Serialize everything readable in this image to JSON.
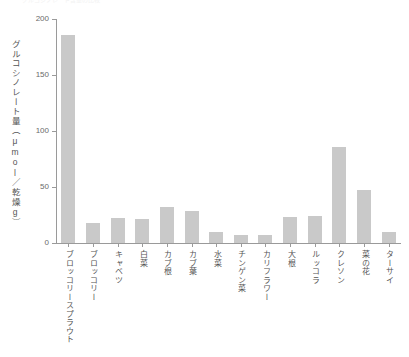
{
  "figure": {
    "top_clipped_text": "グルコシノレート含量の比較",
    "background_color": "#ffffff",
    "bar_color": "#c9c9c9",
    "axis_color": "#9a9a9a",
    "text_color": "#555555"
  },
  "chart_data": {
    "type": "bar",
    "title": "",
    "xlabel": "",
    "ylabel": "グルコシノレート量（μmol／乾燥g）",
    "ylim": [
      0,
      200
    ],
    "yticks": [
      0,
      50,
      100,
      150,
      200
    ],
    "ytick_labels": [
      "0",
      "50",
      "100",
      "150",
      "200"
    ],
    "grid": false,
    "legend": false,
    "categories": [
      "ブロッコリースプラウト",
      "ブロッコリー",
      "キャベツ",
      "白菜",
      "カブ根",
      "カブ葉",
      "水菜",
      "チンゲン菜",
      "カリフラワー",
      "大根",
      "ルッコラ",
      "クレソン",
      "菜の花",
      "ターサイ"
    ],
    "values": [
      186,
      18,
      22,
      21,
      32,
      29,
      10,
      7,
      7,
      23,
      24,
      86,
      47,
      10
    ]
  }
}
